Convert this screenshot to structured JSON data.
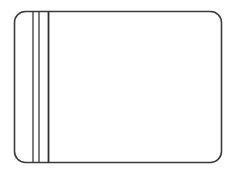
{
  "document": {
    "title": "Blank Rounded Card Outline",
    "type": "line-drawing",
    "width": 234,
    "height": 173,
    "background_color": "#ffffff",
    "text_content": "",
    "notes": "Monochrome outline drawing: a rounded rectangle with three vertical rule lines near the left edge."
  },
  "drawing": {
    "stroke_color": "#3a3a3a",
    "fill_color": "#ffffff",
    "outline": {
      "name": "rounded-rectangle",
      "x": 14.5,
      "y": 11.5,
      "width": 207,
      "height": 151,
      "corner_radius": 11,
      "stroke_width": 1.6,
      "fill": "#ffffff"
    },
    "rule_lines": [
      {
        "label": "rule-line-1",
        "x": 33,
        "y1": 11.5,
        "y2": 162.5,
        "stroke_width": 1.3,
        "color": "#3a3a3a"
      },
      {
        "label": "rule-line-2",
        "x": 39,
        "y1": 11.5,
        "y2": 162.5,
        "stroke_width": 1.3,
        "color": "#3a3a3a"
      },
      {
        "label": "rule-line-3",
        "x": 48.5,
        "y1": 11.5,
        "y2": 162.5,
        "stroke_width": 1.8,
        "color": "#2e2e2e"
      }
    ]
  }
}
